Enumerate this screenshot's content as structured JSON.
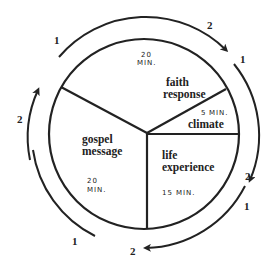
{
  "diagram": {
    "type": "cycle-pie",
    "segments": [
      {
        "id": "faith-response",
        "label_line1": "faith",
        "label_line2": "response",
        "duration": "20",
        "unit": "MIN."
      },
      {
        "id": "climate",
        "label_line1": "climate",
        "duration": "5",
        "unit": "MIN."
      },
      {
        "id": "life-experience",
        "label_line1": "life",
        "label_line2": "experience",
        "duration": "15",
        "unit": "MIN."
      },
      {
        "id": "gospel-message",
        "label_line1": "gospel",
        "label_line2": "message",
        "duration": "20",
        "unit": "MIN."
      }
    ],
    "outer_labels": {
      "top_left_1": "1",
      "top_right_2": "2",
      "right_1": "1",
      "right_2": "2",
      "lower_right_1": "1",
      "bottom_2": "2",
      "bottom_left_1": "1",
      "left_2": "2"
    },
    "colors": {
      "ink": "#222222",
      "background": "#ffffff"
    }
  }
}
